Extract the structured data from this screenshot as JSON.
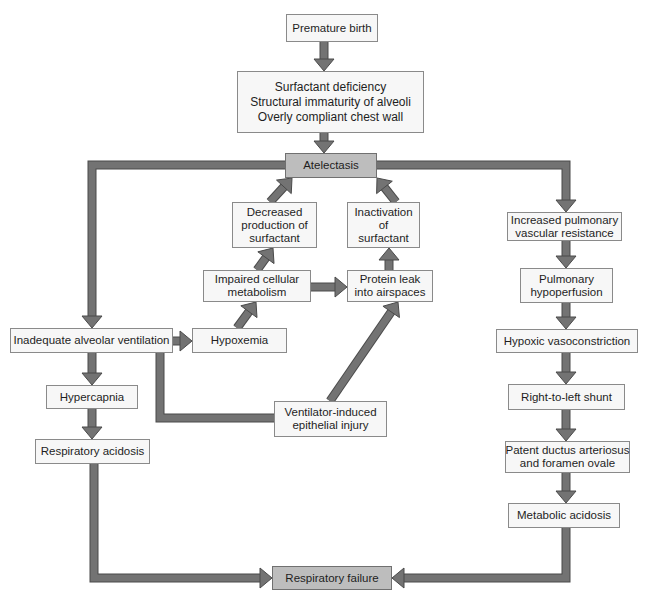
{
  "diagram": {
    "type": "flowchart",
    "colors": {
      "node_fill": "#f7f7f7",
      "key_node_fill": "#bdbdbd",
      "node_border": "#8a8a8a",
      "arrow_fill": "#737373",
      "arrow_outline": "#4a4a4a"
    },
    "nodes": {
      "premature": {
        "lines": [
          "Premature birth"
        ]
      },
      "surfactant": {
        "lines": [
          "Surfactant deficiency",
          "Structural immaturity of alveoli",
          "Overly compliant chest wall"
        ]
      },
      "atelectasis": {
        "lines": [
          "Atelectasis"
        ]
      },
      "decreased": {
        "lines": [
          "Decreased",
          "production of",
          "surfactant"
        ]
      },
      "inactivation": {
        "lines": [
          "Inactivation",
          "of",
          "surfactant"
        ]
      },
      "impaired": {
        "lines": [
          "Impaired cellular",
          "metabolism"
        ]
      },
      "protein": {
        "lines": [
          "Protein leak",
          "into airspaces"
        ]
      },
      "inadequate": {
        "lines": [
          "Inadequate alveolar ventilation"
        ]
      },
      "hypoxemia": {
        "lines": [
          "Hypoxemia"
        ]
      },
      "hypercapnia": {
        "lines": [
          "Hypercapnia"
        ]
      },
      "respacidosis": {
        "lines": [
          "Respiratory acidosis"
        ]
      },
      "ventilator": {
        "lines": [
          "Ventilator-induced",
          "epithelial injury"
        ]
      },
      "respfailure": {
        "lines": [
          "Respiratory failure"
        ]
      },
      "increased": {
        "lines": [
          "Increased pulmonary",
          "vascular resistance"
        ]
      },
      "pulmhypo": {
        "lines": [
          "Pulmonary",
          "hypoperfusion"
        ]
      },
      "hypoxic": {
        "lines": [
          "Hypoxic vasoconstriction"
        ]
      },
      "rtl": {
        "lines": [
          "Right-to-left shunt"
        ]
      },
      "patent": {
        "lines": [
          "Patent ductus arteriosus",
          "and foramen ovale"
        ]
      },
      "metabolic": {
        "lines": [
          "Metabolic acidosis"
        ]
      }
    },
    "edges": [
      {
        "from": "premature",
        "to": "surfactant"
      },
      {
        "from": "surfactant",
        "to": "atelectasis"
      },
      {
        "from": "atelectasis",
        "to": "inadequate"
      },
      {
        "from": "atelectasis",
        "to": "increased"
      },
      {
        "from": "decreased",
        "to": "atelectasis"
      },
      {
        "from": "inactivation",
        "to": "atelectasis"
      },
      {
        "from": "impaired",
        "to": "decreased"
      },
      {
        "from": "protein",
        "to": "inactivation"
      },
      {
        "from": "impaired",
        "to": "protein"
      },
      {
        "from": "hypoxemia",
        "to": "impaired"
      },
      {
        "from": "inadequate",
        "to": "hypoxemia"
      },
      {
        "from": "inadequate",
        "to": "hypercapnia"
      },
      {
        "from": "hypercapnia",
        "to": "respacidosis"
      },
      {
        "from": "inadequate",
        "to": "ventilator"
      },
      {
        "from": "ventilator",
        "to": "protein"
      },
      {
        "from": "respacidosis",
        "to": "respfailure"
      },
      {
        "from": "increased",
        "to": "pulmhypo"
      },
      {
        "from": "pulmhypo",
        "to": "hypoxic"
      },
      {
        "from": "hypoxic",
        "to": "rtl"
      },
      {
        "from": "rtl",
        "to": "patent"
      },
      {
        "from": "patent",
        "to": "metabolic"
      },
      {
        "from": "metabolic",
        "to": "respfailure"
      }
    ]
  }
}
